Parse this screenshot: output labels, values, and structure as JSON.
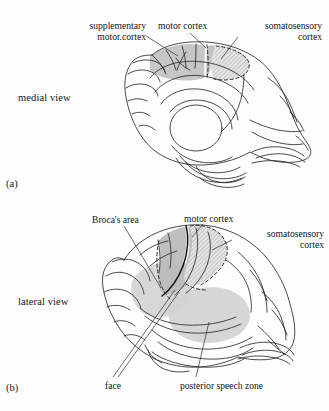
{
  "figure": {
    "background": "#fdfdfd",
    "ink": "#2b2b2b",
    "shade_solid": "#c9c9c9",
    "shade_light": "#d6d6d6",
    "shade_hatch": "#d2d2d2"
  },
  "panels": [
    {
      "id": "a",
      "letter": "(a)",
      "view_label": "medial view",
      "callouts": [
        {
          "name": "supplementary-motor-cortex",
          "line1": "supplementary",
          "line2": "motor.cortex"
        },
        {
          "name": "motor-cortex",
          "line1": "motor cortex",
          "line2": ""
        },
        {
          "name": "somatosensory-cortex",
          "line1": "somatosensory",
          "line2": "cortex"
        }
      ]
    },
    {
      "id": "b",
      "letter": "(b)",
      "view_label": "lateral view",
      "callouts": [
        {
          "name": "brocas-area",
          "line1": "Broca's area",
          "line2": ""
        },
        {
          "name": "motor-cortex",
          "line1": "motor cortex",
          "line2": ""
        },
        {
          "name": "somatosensory-cortex",
          "line1": "somatosensory",
          "line2": "cortex"
        },
        {
          "name": "face",
          "line1": "face",
          "line2": ""
        },
        {
          "name": "posterior-speech-zone",
          "line1": "posterior speech zone",
          "line2": ""
        }
      ]
    }
  ]
}
